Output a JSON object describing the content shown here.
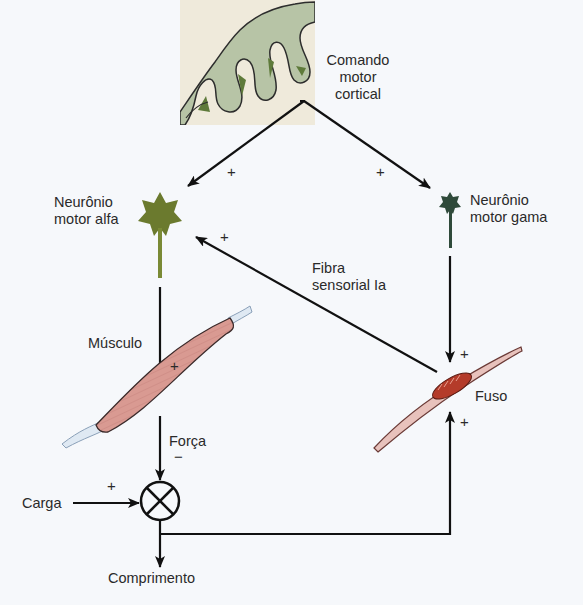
{
  "diagram": {
    "title": "",
    "colors": {
      "background": "#f6f8fb",
      "cortex_gray_matter": "#b7c4a6",
      "cortex_white_matter": "#efeadb",
      "cortex_dark": "#5e7a3a",
      "alpha_neuron": "#6b7a2e",
      "gamma_neuron": "#2f4a3a",
      "muscle": "#d99a92",
      "tendon": "#dfe9f3",
      "spindle_core": "#b43b2a",
      "line": "#111111"
    },
    "nodes": {
      "cortex": {
        "label": "Comando\nmotor\ncortical"
      },
      "alpha": {
        "label": "Neurônio\nmotor alfa"
      },
      "gamma": {
        "label": "Neurônio\nmotor gama"
      },
      "ia_fiber": {
        "label": "Fibra\nsensorial Ia"
      },
      "muscle": {
        "label": "Músculo"
      },
      "spindle": {
        "label": "Fuso"
      },
      "force": {
        "label": "Força"
      },
      "load": {
        "label": "Carga"
      },
      "length": {
        "label": "Comprimento"
      },
      "summing_junction": {
        "label": "⊗"
      }
    },
    "edges": [
      {
        "from": "cortex",
        "to": "alpha",
        "sign": "+"
      },
      {
        "from": "cortex",
        "to": "gamma",
        "sign": "+"
      },
      {
        "from": "spindle",
        "to": "alpha",
        "via": "ia_fiber",
        "sign": "+"
      },
      {
        "from": "alpha",
        "to": "muscle",
        "sign": "+"
      },
      {
        "from": "gamma",
        "to": "spindle",
        "sign": "+"
      },
      {
        "from": "muscle",
        "to": "summing_junction",
        "via": "force",
        "sign": "−"
      },
      {
        "from": "load",
        "to": "summing_junction",
        "sign": "+"
      },
      {
        "from": "summing_junction",
        "to": "length",
        "sign": ""
      },
      {
        "from": "length",
        "to": "spindle",
        "sign": "+"
      }
    ],
    "signs": {
      "cortex_alpha": "+",
      "cortex_gamma": "+",
      "ia_alpha": "+",
      "alpha_muscle": "+",
      "gamma_spindle": "+",
      "force_sum": "−",
      "load_sum": "+",
      "length_spindle": "+"
    }
  }
}
